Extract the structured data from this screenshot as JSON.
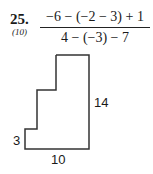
{
  "problem": {
    "number": "25.",
    "reference": "(10)",
    "numerator": "−6 − (−2 − 3) + 1",
    "denominator": "4 − (−3) − 7"
  },
  "figure": {
    "labels": {
      "right": "14",
      "left": "3",
      "bottom": "10"
    },
    "stroke_color": "#333333"
  }
}
